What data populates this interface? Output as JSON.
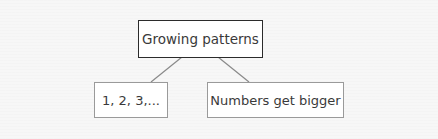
{
  "diagram": {
    "type": "tree",
    "root": {
      "label": "Growing patterns"
    },
    "children": [
      {
        "label": "1, 2, 3,..."
      },
      {
        "label": "Numbers get bigger"
      }
    ],
    "colors": {
      "background": "#f7f7f7",
      "root_border": "#2b2b2b",
      "child_border": "#9a9a9a",
      "connector": "#8a8a8a",
      "text": "#3a3a3a"
    }
  }
}
